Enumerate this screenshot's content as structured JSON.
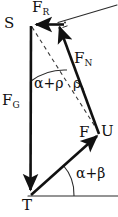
{
  "figure": {
    "type": "force-vector-diagram",
    "width": 118,
    "height": 217,
    "background": "#ffffff",
    "stroke_color": "#111111",
    "points": {
      "S": {
        "label": "S",
        "x": 31,
        "y": 25
      },
      "T": {
        "label": "T",
        "x": 30,
        "y": 196
      },
      "U": {
        "label": "U",
        "x": 100,
        "y": 133
      },
      "F_tip": {
        "label": "F",
        "x": 100,
        "y": 133
      }
    },
    "vectors": [
      {
        "name": "F_R",
        "label": "F",
        "subscript": "R",
        "from": {
          "x": 62,
          "y": 25
        },
        "to": {
          "x": 31,
          "y": 25
        },
        "style": "solid",
        "arrow": "end"
      },
      {
        "name": "F_G",
        "label": "F",
        "subscript": "G",
        "from": {
          "x": 31,
          "y": 25
        },
        "to": {
          "x": 30,
          "y": 196
        },
        "style": "solid",
        "arrow": "end"
      },
      {
        "name": "F_N",
        "label": "F",
        "subscript": "N",
        "from": {
          "x": 98,
          "y": 133
        },
        "to": {
          "x": 58,
          "y": 22
        },
        "style": "solid",
        "arrow": "end"
      },
      {
        "name": "F",
        "label": "F",
        "subscript": "",
        "from": {
          "x": 30,
          "y": 196
        },
        "to": {
          "x": 100,
          "y": 133
        },
        "style": "solid",
        "arrow": "end"
      }
    ],
    "lines": [
      {
        "name": "inclined-surface-line",
        "from": {
          "x": 58,
          "y": 22
        },
        "to": {
          "x": 117,
          "y": 5
        },
        "style": "thin-solid"
      },
      {
        "name": "ground-baseline",
        "from": {
          "x": 28,
          "y": 196
        },
        "to": {
          "x": 118,
          "y": 196
        },
        "style": "thin-solid"
      },
      {
        "name": "dashed-construction-line",
        "from": {
          "x": 31,
          "y": 25
        },
        "to": {
          "x": 96,
          "y": 128
        },
        "style": "dashed"
      }
    ],
    "angles": [
      {
        "name": "alpha-plus-rho",
        "label": "α+ρ",
        "vertex": "S",
        "arc_radius": 55
      },
      {
        "name": "rho",
        "label": "ρ",
        "vertex": "F_N-dashed-crossing",
        "arc_radius": 12
      },
      {
        "name": "alpha-plus-beta",
        "label": "α+β",
        "vertex": "T",
        "arc_radius": 44
      }
    ],
    "markers": [
      {
        "name": "right-angle-mark",
        "x": 64,
        "y": 23,
        "note": "right angle between F_N and inclined surface line"
      }
    ],
    "labels": {
      "point_S": "S",
      "point_T": "T",
      "point_U": "U",
      "force_resultant": "F",
      "force_resultant_sub": "R",
      "force_gravity": "F",
      "force_gravity_sub": "G",
      "force_normal": "F",
      "force_normal_sub": "N",
      "force_f": "F",
      "angle_alpha_rho": "α+ρ",
      "angle_rho": "ρ",
      "angle_alpha_beta": "α+β"
    }
  }
}
